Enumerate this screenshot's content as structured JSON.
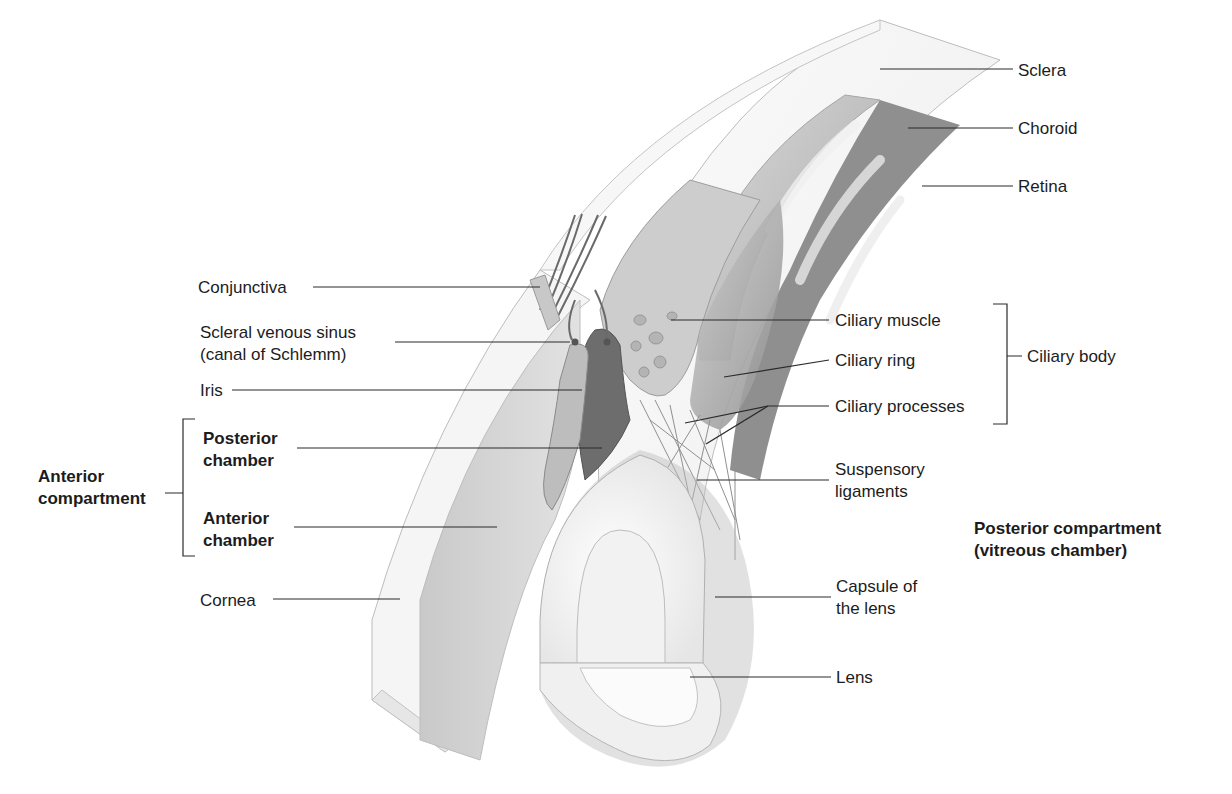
{
  "figure": {
    "colors": {
      "background": "#ffffff",
      "label_text": "#1c1c1c",
      "leader_line": "#2a2a2a",
      "sclera": "#f4f4f4",
      "choroid": "#9a9a9a",
      "retina": "#c9c9c9",
      "anterior_chamber": "#d2d2d2",
      "posterior_chamber": "#6e6e6e",
      "lens": "#fafafa",
      "ciliary_body": "#c4c4c4"
    }
  },
  "labels": {
    "sclera": {
      "text": "Sclera",
      "x": 1018,
      "y": 60
    },
    "choroid": {
      "text": "Choroid",
      "x": 1018,
      "y": 118
    },
    "retina": {
      "text": "Retina",
      "x": 1018,
      "y": 176
    },
    "conjunctiva": {
      "text": "Conjunctiva",
      "x": 198,
      "y": 277
    },
    "scleral_sinus_line1": {
      "text": "Scleral venous sinus",
      "x": 200,
      "y": 322
    },
    "scleral_sinus_line2": {
      "text": "(canal of Schlemm)",
      "x": 200,
      "y": 344
    },
    "iris": {
      "text": "Iris",
      "x": 200,
      "y": 380
    },
    "posterior_chamber_line1": {
      "text": "Posterior",
      "x": 203,
      "y": 428
    },
    "posterior_chamber_line2": {
      "text": "chamber",
      "x": 203,
      "y": 450
    },
    "anterior_compartment_line1": {
      "text": "Anterior",
      "x": 38,
      "y": 466
    },
    "anterior_compartment_line2": {
      "text": "compartment",
      "x": 38,
      "y": 488
    },
    "anterior_chamber_line1": {
      "text": "Anterior",
      "x": 203,
      "y": 508
    },
    "anterior_chamber_line2": {
      "text": "chamber",
      "x": 203,
      "y": 530
    },
    "cornea": {
      "text": "Cornea",
      "x": 200,
      "y": 590
    },
    "ciliary_muscle": {
      "text": "Ciliary muscle",
      "x": 835,
      "y": 310
    },
    "ciliary_ring": {
      "text": "Ciliary ring",
      "x": 835,
      "y": 350
    },
    "ciliary_processes": {
      "text": "Ciliary processes",
      "x": 835,
      "y": 396
    },
    "ciliary_body": {
      "text": "Ciliary body",
      "x": 1027,
      "y": 346
    },
    "suspensory_line1": {
      "text": "Suspensory",
      "x": 835,
      "y": 459
    },
    "suspensory_line2": {
      "text": "ligaments",
      "x": 835,
      "y": 481
    },
    "posterior_compartment_line1": {
      "text": "Posterior compartment",
      "x": 974,
      "y": 518
    },
    "posterior_compartment_line2": {
      "text": "(vitreous chamber)",
      "x": 974,
      "y": 540
    },
    "capsule_line1": {
      "text": "Capsule of",
      "x": 836,
      "y": 576
    },
    "capsule_line2": {
      "text": "the lens",
      "x": 836,
      "y": 598
    },
    "lens": {
      "text": "Lens",
      "x": 836,
      "y": 667
    }
  },
  "leaders": [
    {
      "name": "sclera",
      "x1": 880,
      "y1": 69,
      "x2": 1013,
      "y2": 69
    },
    {
      "name": "choroid",
      "x1": 908,
      "y1": 128,
      "x2": 1013,
      "y2": 128
    },
    {
      "name": "retina",
      "x1": 922,
      "y1": 186,
      "x2": 1013,
      "y2": 186
    },
    {
      "name": "conjunctiva",
      "x1": 313,
      "y1": 287,
      "x2": 540,
      "y2": 287
    },
    {
      "name": "scleral-sinus",
      "x1": 395,
      "y1": 342,
      "x2": 570,
      "y2": 342
    },
    {
      "name": "iris",
      "x1": 232,
      "y1": 390,
      "x2": 582,
      "y2": 390
    },
    {
      "name": "posterior-chamber",
      "x1": 297,
      "y1": 448,
      "x2": 602,
      "y2": 448
    },
    {
      "name": "anterior-chamber",
      "x1": 294,
      "y1": 527,
      "x2": 497,
      "y2": 527
    },
    {
      "name": "cornea",
      "x1": 273,
      "y1": 599,
      "x2": 400,
      "y2": 599
    },
    {
      "name": "ciliary-muscle",
      "x1": 671,
      "y1": 320,
      "x2": 829,
      "y2": 320
    },
    {
      "name": "ciliary-ring",
      "x1": 724,
      "y1": 377,
      "x2": 829,
      "y2": 360
    },
    {
      "name": "ciliary-processes-a",
      "x1": 685,
      "y1": 423,
      "x2": 768,
      "y2": 406
    },
    {
      "name": "ciliary-processes-b",
      "x1": 706,
      "y1": 444,
      "x2": 768,
      "y2": 406
    },
    {
      "name": "ciliary-processes-c",
      "x1": 768,
      "y1": 406,
      "x2": 829,
      "y2": 406
    },
    {
      "name": "suspensory",
      "x1": 697,
      "y1": 480,
      "x2": 829,
      "y2": 480
    },
    {
      "name": "capsule",
      "x1": 715,
      "y1": 597,
      "x2": 831,
      "y2": 597
    },
    {
      "name": "lens",
      "x1": 690,
      "y1": 677,
      "x2": 831,
      "y2": 677
    }
  ],
  "brackets": {
    "ciliary_body": {
      "x": 1007,
      "y_top": 304,
      "y_bottom": 424,
      "tick_to": 1022,
      "mid_y": 356
    },
    "anterior_compartment": {
      "x": 183,
      "y_top": 419,
      "y_bottom": 556,
      "tick_from": 165,
      "mid_y": 493
    }
  }
}
